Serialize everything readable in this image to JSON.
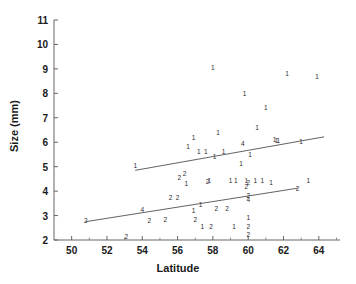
{
  "chart_data": {
    "type": "scatter",
    "title": "",
    "xlabel": "Latitude",
    "ylabel": "Size (mm)",
    "xlim": [
      49,
      65.2
    ],
    "ylim": [
      2,
      11
    ],
    "xticks": [
      50,
      52,
      54,
      56,
      58,
      60,
      62,
      64
    ],
    "xtick_labels": [
      "50",
      "52",
      "54",
      "56",
      "58",
      "60",
      "62",
      "64"
    ],
    "xminor_ticks": [
      51,
      53,
      55,
      57,
      59,
      61,
      63,
      65
    ],
    "yticks": [
      2,
      3,
      4,
      5,
      6,
      7,
      8,
      9,
      10,
      11
    ],
    "ytick_labels": [
      "2",
      "3",
      "4",
      "5",
      "6",
      "7",
      "8",
      "9",
      "10",
      "11"
    ],
    "grid": false,
    "legend": null,
    "marker_note": "Each plotted glyph is a digit giving the number of coincident observations at that location",
    "points": [
      {
        "x": 50.8,
        "y": 2.78,
        "label": "2"
      },
      {
        "x": 53.1,
        "y": 2.12,
        "label": "2"
      },
      {
        "x": 53.6,
        "y": 5.02,
        "label": "1"
      },
      {
        "x": 54.0,
        "y": 3.22,
        "label": "4"
      },
      {
        "x": 54.4,
        "y": 2.78,
        "label": "2"
      },
      {
        "x": 55.3,
        "y": 2.8,
        "label": "2"
      },
      {
        "x": 55.6,
        "y": 3.72,
        "label": "2"
      },
      {
        "x": 56.0,
        "y": 3.72,
        "label": "2"
      },
      {
        "x": 56.1,
        "y": 4.52,
        "label": "2"
      },
      {
        "x": 56.4,
        "y": 4.7,
        "label": "2"
      },
      {
        "x": 56.5,
        "y": 4.3,
        "label": "1"
      },
      {
        "x": 56.6,
        "y": 5.8,
        "label": "1"
      },
      {
        "x": 56.9,
        "y": 6.18,
        "label": "1"
      },
      {
        "x": 56.9,
        "y": 3.18,
        "label": "1"
      },
      {
        "x": 57.0,
        "y": 2.8,
        "label": "2"
      },
      {
        "x": 57.2,
        "y": 5.62,
        "label": "1"
      },
      {
        "x": 57.3,
        "y": 3.42,
        "label": "1"
      },
      {
        "x": 57.4,
        "y": 2.52,
        "label": "1"
      },
      {
        "x": 57.6,
        "y": 5.6,
        "label": "1"
      },
      {
        "x": 57.7,
        "y": 4.38,
        "label": "2"
      },
      {
        "x": 57.8,
        "y": 4.42,
        "label": "1"
      },
      {
        "x": 57.9,
        "y": 2.52,
        "label": "2"
      },
      {
        "x": 58.0,
        "y": 9.02,
        "label": "1"
      },
      {
        "x": 58.1,
        "y": 5.38,
        "label": "1"
      },
      {
        "x": 58.2,
        "y": 3.28,
        "label": "2"
      },
      {
        "x": 58.3,
        "y": 6.38,
        "label": "1"
      },
      {
        "x": 58.6,
        "y": 5.6,
        "label": "1"
      },
      {
        "x": 58.8,
        "y": 3.28,
        "label": "2"
      },
      {
        "x": 59.0,
        "y": 4.42,
        "label": "1"
      },
      {
        "x": 59.2,
        "y": 2.52,
        "label": "1"
      },
      {
        "x": 59.3,
        "y": 4.42,
        "label": "1"
      },
      {
        "x": 59.6,
        "y": 5.1,
        "label": "1"
      },
      {
        "x": 59.7,
        "y": 5.92,
        "label": "4"
      },
      {
        "x": 59.8,
        "y": 7.98,
        "label": "1"
      },
      {
        "x": 59.9,
        "y": 4.4,
        "label": "1"
      },
      {
        "x": 59.9,
        "y": 4.18,
        "label": "2"
      },
      {
        "x": 60.0,
        "y": 3.8,
        "label": "2"
      },
      {
        "x": 60.0,
        "y": 3.62,
        "label": "4"
      },
      {
        "x": 60.0,
        "y": 4.32,
        "label": "2"
      },
      {
        "x": 60.0,
        "y": 2.9,
        "label": "1"
      },
      {
        "x": 60.0,
        "y": 2.52,
        "label": "2"
      },
      {
        "x": 60.0,
        "y": 2.2,
        "label": "2"
      },
      {
        "x": 60.1,
        "y": 5.48,
        "label": "1"
      },
      {
        "x": 60.4,
        "y": 4.4,
        "label": "1"
      },
      {
        "x": 60.5,
        "y": 6.58,
        "label": "1"
      },
      {
        "x": 60.8,
        "y": 4.42,
        "label": "1"
      },
      {
        "x": 61.0,
        "y": 7.42,
        "label": "1"
      },
      {
        "x": 61.3,
        "y": 4.32,
        "label": "1"
      },
      {
        "x": 61.5,
        "y": 6.08,
        "label": "1"
      },
      {
        "x": 61.6,
        "y": 6.06,
        "label": "1"
      },
      {
        "x": 61.7,
        "y": 6.06,
        "label": "1"
      },
      {
        "x": 62.2,
        "y": 8.78,
        "label": "1"
      },
      {
        "x": 62.8,
        "y": 4.1,
        "label": "2"
      },
      {
        "x": 63.0,
        "y": 6.02,
        "label": "1"
      },
      {
        "x": 63.4,
        "y": 4.4,
        "label": "1"
      },
      {
        "x": 63.9,
        "y": 8.68,
        "label": "1"
      }
    ],
    "lines": [
      {
        "name": "upper-fit-line",
        "x": [
          53.6,
          64.3
        ],
        "y": [
          4.85,
          6.22
        ]
      },
      {
        "name": "lower-fit-line",
        "x": [
          50.8,
          62.8
        ],
        "y": [
          2.75,
          4.12
        ]
      }
    ]
  }
}
